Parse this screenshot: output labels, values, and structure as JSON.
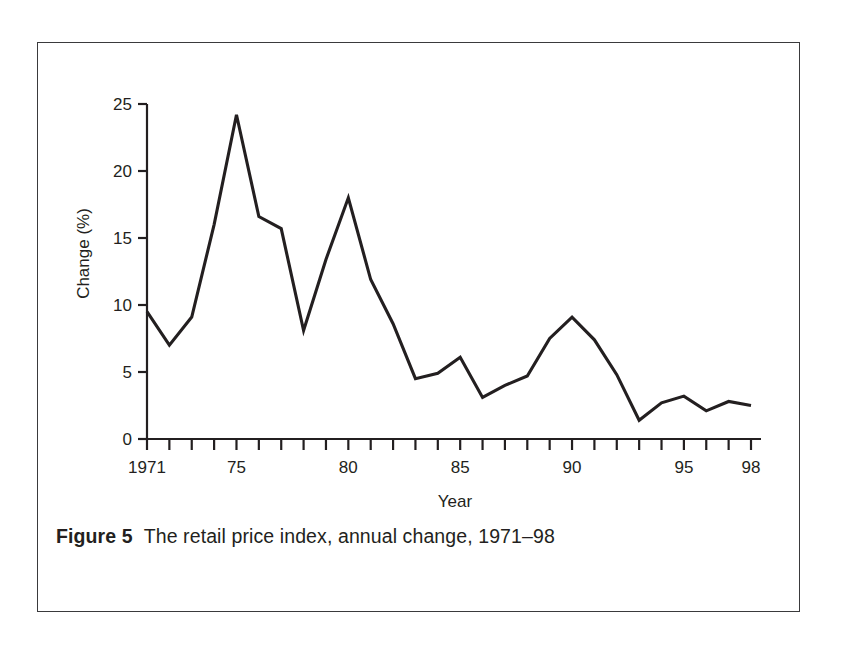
{
  "figure": {
    "caption_label": "Figure 5",
    "caption_text": "The retail price index, annual change, 1971–98",
    "border_color": "#3a3a3c",
    "background_color": "#ffffff",
    "line_color": "#231f20"
  },
  "chart_data": {
    "type": "line",
    "title": "",
    "subtitle": "",
    "xlabel": "Year",
    "ylabel": "Change (%)",
    "xlim": [
      1971,
      1998
    ],
    "ylim": [
      0,
      25
    ],
    "yticks": [
      0,
      5,
      10,
      15,
      20,
      25
    ],
    "ytick_labels": [
      "0",
      "5",
      "10",
      "15",
      "20",
      "25"
    ],
    "xticks": [
      1971,
      1972,
      1973,
      1974,
      1975,
      1976,
      1977,
      1978,
      1979,
      1980,
      1981,
      1982,
      1983,
      1984,
      1985,
      1986,
      1987,
      1988,
      1989,
      1990,
      1991,
      1992,
      1993,
      1994,
      1995,
      1996,
      1997,
      1998
    ],
    "xtick_labeled": [
      {
        "x": 1971,
        "label": "1971"
      },
      {
        "x": 1975,
        "label": "75"
      },
      {
        "x": 1980,
        "label": "80"
      },
      {
        "x": 1985,
        "label": "85"
      },
      {
        "x": 1990,
        "label": "90"
      },
      {
        "x": 1995,
        "label": "95"
      },
      {
        "x": 1998,
        "label": "98"
      }
    ],
    "grid": false,
    "legend": false,
    "legend_position": "none",
    "x": [
      1971,
      1972,
      1973,
      1974,
      1975,
      1976,
      1977,
      1978,
      1979,
      1980,
      1981,
      1982,
      1983,
      1984,
      1985,
      1986,
      1987,
      1988,
      1989,
      1990,
      1991,
      1992,
      1993,
      1994,
      1995,
      1996,
      1997,
      1998
    ],
    "values": [
      9.5,
      7.0,
      9.1,
      16.0,
      24.2,
      16.6,
      15.7,
      8.1,
      13.4,
      18.0,
      11.9,
      8.6,
      4.5,
      4.9,
      6.1,
      3.1,
      4.0,
      4.7,
      7.5,
      9.1,
      7.4,
      4.8,
      1.4,
      2.7,
      3.2,
      2.1,
      2.8,
      2.5
    ],
    "series": [
      {
        "name": "Retail price index annual change",
        "values": [
          9.5,
          7.0,
          9.1,
          16.0,
          24.2,
          16.6,
          15.7,
          8.1,
          13.4,
          18.0,
          11.9,
          8.6,
          4.5,
          4.9,
          6.1,
          3.1,
          4.0,
          4.7,
          7.5,
          9.1,
          7.4,
          4.8,
          1.4,
          2.7,
          3.2,
          2.1,
          2.8,
          2.5
        ]
      }
    ]
  }
}
